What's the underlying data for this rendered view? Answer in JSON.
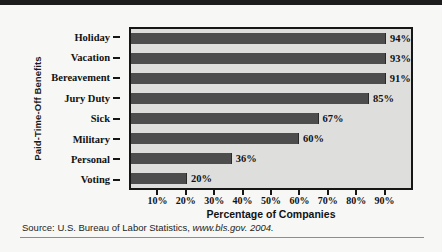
{
  "figure": {
    "source_note_prefix": "Source: U.S. Bureau of Labor Statistics, ",
    "source_note_italic": "www.bls.gov. 2004."
  },
  "colors": {
    "bar": "#4d4d4d",
    "plot_background": "#dededd",
    "axis": "#161616",
    "text": "#111111"
  },
  "chart_data": {
    "type": "bar",
    "orientation": "horizontal",
    "title": "",
    "xlabel": "Percentage of Companies",
    "ylabel": "Paid-Time-Off Benefits",
    "categories": [
      "Holiday",
      "Vacation",
      "Bereavement",
      "Jury Duty",
      "Sick",
      "Military",
      "Personal",
      "Voting"
    ],
    "values": [
      94,
      93,
      91,
      85,
      67,
      60,
      36,
      20
    ],
    "value_labels": [
      "94%",
      "93%",
      "91%",
      "85%",
      "67%",
      "60%",
      "36%",
      "20%"
    ],
    "xlim": [
      0,
      100
    ],
    "xticks": [
      10,
      20,
      30,
      40,
      50,
      60,
      70,
      80,
      90
    ],
    "xtick_labels": [
      "10%",
      "20%",
      "30%",
      "40%",
      "50%",
      "60%",
      "70%",
      "80%",
      "90%"
    ],
    "grid": false,
    "legend": null
  }
}
